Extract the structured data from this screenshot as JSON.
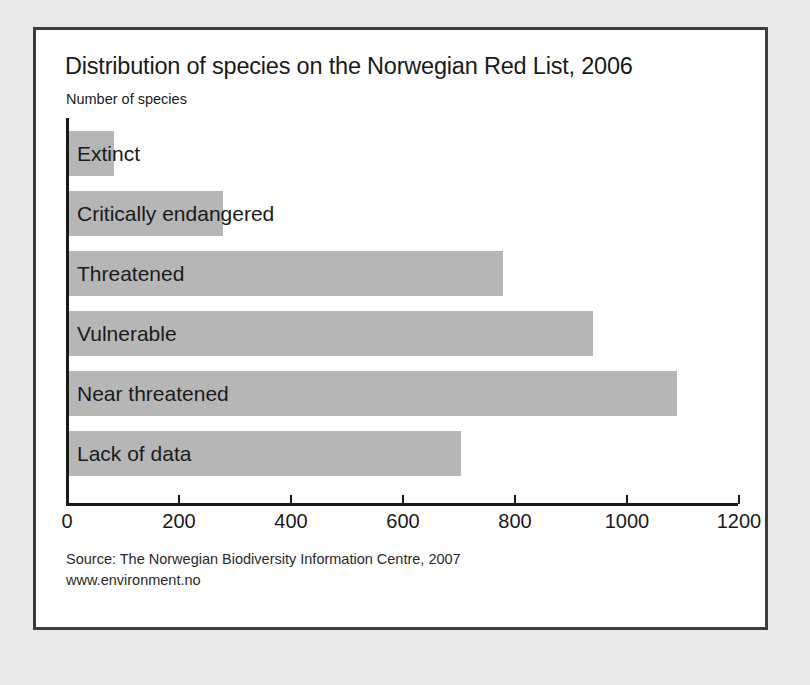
{
  "chart_data": {
    "type": "bar",
    "orientation": "horizontal",
    "title": "Distribution of species on the Norwegian Red List, 2006",
    "subtitle": "Number of species",
    "xlabel": "",
    "ylabel": "",
    "categories": [
      "Extinct",
      "Critically endangered",
      "Threatened",
      "Vulnerable",
      "Near threatened",
      "Lack of data"
    ],
    "values": [
      80,
      275,
      775,
      935,
      1085,
      700
    ],
    "xlim": [
      0,
      1200
    ],
    "xticks": [
      0,
      200,
      400,
      600,
      800,
      1000,
      1200
    ],
    "xtick_labels": [
      "0",
      "200",
      "400",
      "600",
      "800",
      "1000",
      "1200"
    ],
    "grid": false,
    "legend": null,
    "bar_color": "#b6b6b6",
    "axis_color": "#1a1a1a",
    "text_color": "#1a1a1a"
  },
  "source": {
    "line": "Source: The Norwegian Biodiversity Information Centre, 2007",
    "url": "www.environment.no"
  },
  "frame": {
    "border_color": "#3c3c3c",
    "panel_background": "#ffffff",
    "page_background": "#e9e9e9"
  }
}
